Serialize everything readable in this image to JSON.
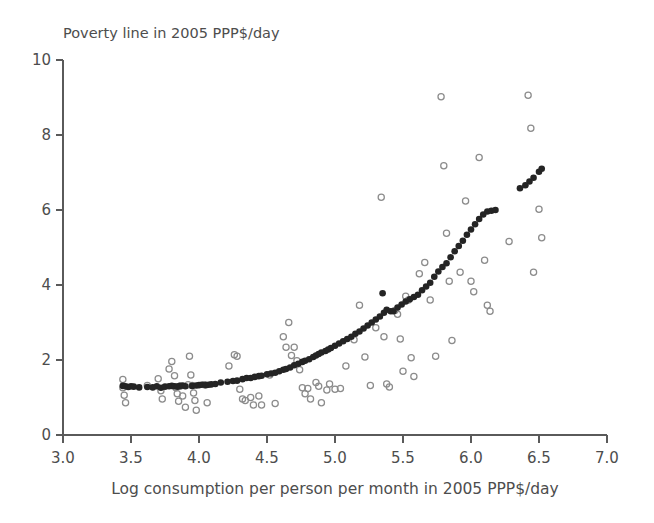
{
  "figure": {
    "title": "Poverty line in 2005 PPP$/day",
    "xlabel": "Log consumption per person per month in 2005 PPP$/day",
    "background": "#ffffff",
    "fitted_color": "#242424",
    "observed_color": "#8c8c8c",
    "axis_color": "#5a5a5a"
  },
  "chart_data": {
    "type": "scatter",
    "title": "Poverty line in 2005 PPP$/day",
    "xlabel": "Log consumption per person per month in 2005 PPP$/day",
    "ylabel": "Poverty line in 2005 PPP$/day",
    "xlim": [
      3.0,
      7.0
    ],
    "ylim": [
      0,
      10
    ],
    "xticks": [
      "3.0",
      "3.5",
      "4.0",
      "4.5",
      "5.0",
      "5.5",
      "6.0",
      "6.5",
      "7.0"
    ],
    "xtick_values": [
      3.0,
      3.5,
      4.0,
      4.5,
      5.0,
      5.5,
      6.0,
      6.5,
      7.0
    ],
    "yticks": [
      "0",
      "2",
      "4",
      "6",
      "8",
      "10"
    ],
    "ytick_values": [
      0,
      2,
      4,
      6,
      8,
      10
    ],
    "grid": false,
    "legend": false,
    "series": [
      {
        "name": "Fitted poverty line",
        "marker": "filled-circle",
        "color": "#242424",
        "points": [
          [
            3.44,
            1.31
          ],
          [
            3.46,
            1.3
          ],
          [
            3.48,
            1.28
          ],
          [
            3.5,
            1.3
          ],
          [
            3.52,
            1.29
          ],
          [
            3.56,
            1.27
          ],
          [
            3.62,
            1.28
          ],
          [
            3.66,
            1.27
          ],
          [
            3.69,
            1.3
          ],
          [
            3.72,
            1.26
          ],
          [
            3.75,
            1.29
          ],
          [
            3.78,
            1.3
          ],
          [
            3.8,
            1.31
          ],
          [
            3.82,
            1.3
          ],
          [
            3.84,
            1.29
          ],
          [
            3.86,
            1.31
          ],
          [
            3.88,
            1.32
          ],
          [
            3.9,
            1.3
          ],
          [
            3.95,
            1.31
          ],
          [
            3.98,
            1.32
          ],
          [
            4.0,
            1.33
          ],
          [
            4.02,
            1.34
          ],
          [
            4.05,
            1.33
          ],
          [
            4.07,
            1.34
          ],
          [
            4.09,
            1.35
          ],
          [
            4.12,
            1.36
          ],
          [
            4.16,
            1.4
          ],
          [
            4.21,
            1.42
          ],
          [
            4.25,
            1.44
          ],
          [
            4.28,
            1.45
          ],
          [
            4.32,
            1.49
          ],
          [
            4.35,
            1.52
          ],
          [
            4.38,
            1.52
          ],
          [
            4.41,
            1.55
          ],
          [
            4.44,
            1.57
          ],
          [
            4.46,
            1.58
          ],
          [
            4.5,
            1.62
          ],
          [
            4.53,
            1.64
          ],
          [
            4.56,
            1.66
          ],
          [
            4.59,
            1.7
          ],
          [
            4.62,
            1.74
          ],
          [
            4.64,
            1.76
          ],
          [
            4.67,
            1.8
          ],
          [
            4.7,
            1.86
          ],
          [
            4.73,
            1.9
          ],
          [
            4.76,
            1.95
          ],
          [
            4.78,
            1.98
          ],
          [
            4.81,
            2.02
          ],
          [
            4.84,
            2.08
          ],
          [
            4.86,
            2.12
          ],
          [
            4.88,
            2.16
          ],
          [
            4.9,
            2.2
          ],
          [
            4.93,
            2.24
          ],
          [
            4.95,
            2.28
          ],
          [
            4.97,
            2.32
          ],
          [
            5.0,
            2.38
          ],
          [
            5.03,
            2.44
          ],
          [
            5.06,
            2.5
          ],
          [
            5.09,
            2.56
          ],
          [
            5.12,
            2.62
          ],
          [
            5.15,
            2.7
          ],
          [
            5.18,
            2.76
          ],
          [
            5.21,
            2.84
          ],
          [
            5.24,
            2.92
          ],
          [
            5.27,
            3.0
          ],
          [
            5.3,
            3.08
          ],
          [
            5.33,
            3.16
          ],
          [
            5.36,
            3.26
          ],
          [
            5.38,
            3.34
          ],
          [
            5.41,
            3.3
          ],
          [
            5.43,
            3.3
          ],
          [
            5.35,
            3.78
          ],
          [
            5.46,
            3.4
          ],
          [
            5.49,
            3.48
          ],
          [
            5.52,
            3.56
          ],
          [
            5.55,
            3.62
          ],
          [
            5.58,
            3.68
          ],
          [
            5.61,
            3.74
          ],
          [
            5.64,
            3.86
          ],
          [
            5.67,
            3.96
          ],
          [
            5.7,
            4.06
          ],
          [
            5.73,
            4.22
          ],
          [
            5.76,
            4.36
          ],
          [
            5.79,
            4.48
          ],
          [
            5.82,
            4.58
          ],
          [
            5.85,
            4.74
          ],
          [
            5.88,
            4.9
          ],
          [
            5.91,
            5.04
          ],
          [
            5.94,
            5.18
          ],
          [
            5.97,
            5.34
          ],
          [
            6.0,
            5.48
          ],
          [
            6.03,
            5.62
          ],
          [
            6.06,
            5.76
          ],
          [
            6.09,
            5.88
          ],
          [
            6.12,
            5.96
          ],
          [
            6.15,
            5.98
          ],
          [
            6.18,
            6.0
          ],
          [
            6.36,
            6.58
          ],
          [
            6.4,
            6.66
          ],
          [
            6.43,
            6.76
          ],
          [
            6.46,
            6.86
          ],
          [
            6.5,
            7.02
          ],
          [
            6.52,
            7.1
          ]
        ]
      },
      {
        "name": "Observed poverty line",
        "marker": "open-circle",
        "color": "#8c8c8c",
        "points": [
          [
            3.44,
            1.48
          ],
          [
            3.44,
            1.26
          ],
          [
            3.45,
            1.06
          ],
          [
            3.46,
            0.86
          ],
          [
            3.62,
            1.32
          ],
          [
            3.7,
            1.5
          ],
          [
            3.72,
            1.18
          ],
          [
            3.73,
            0.96
          ],
          [
            3.78,
            1.76
          ],
          [
            3.8,
            1.96
          ],
          [
            3.82,
            1.58
          ],
          [
            3.83,
            1.26
          ],
          [
            3.84,
            1.1
          ],
          [
            3.85,
            0.9
          ],
          [
            3.86,
            1.3
          ],
          [
            3.88,
            1.04
          ],
          [
            3.9,
            0.74
          ],
          [
            3.92,
            1.34
          ],
          [
            3.93,
            2.1
          ],
          [
            3.94,
            1.6
          ],
          [
            3.95,
            1.32
          ],
          [
            3.96,
            1.12
          ],
          [
            3.97,
            0.92
          ],
          [
            3.98,
            0.66
          ],
          [
            4.04,
            1.34
          ],
          [
            4.06,
            0.86
          ],
          [
            4.22,
            1.84
          ],
          [
            4.26,
            2.14
          ],
          [
            4.28,
            2.1
          ],
          [
            4.3,
            1.22
          ],
          [
            4.32,
            0.96
          ],
          [
            4.34,
            0.92
          ],
          [
            4.38,
            1.0
          ],
          [
            4.4,
            0.8
          ],
          [
            4.44,
            1.04
          ],
          [
            4.46,
            0.8
          ],
          [
            4.52,
            1.6
          ],
          [
            4.56,
            0.84
          ],
          [
            4.62,
            2.62
          ],
          [
            4.64,
            2.34
          ],
          [
            4.66,
            3.0
          ],
          [
            4.68,
            2.12
          ],
          [
            4.7,
            2.34
          ],
          [
            4.72,
            1.98
          ],
          [
            4.74,
            1.74
          ],
          [
            4.76,
            1.26
          ],
          [
            4.78,
            1.1
          ],
          [
            4.8,
            1.24
          ],
          [
            4.82,
            0.96
          ],
          [
            4.86,
            1.4
          ],
          [
            4.88,
            1.3
          ],
          [
            4.9,
            0.86
          ],
          [
            4.94,
            1.2
          ],
          [
            4.96,
            1.36
          ],
          [
            5.0,
            1.22
          ],
          [
            5.04,
            1.24
          ],
          [
            5.08,
            1.84
          ],
          [
            5.14,
            2.54
          ],
          [
            5.18,
            3.46
          ],
          [
            5.22,
            2.08
          ],
          [
            5.26,
            1.32
          ],
          [
            5.3,
            2.86
          ],
          [
            5.34,
            6.34
          ],
          [
            5.36,
            2.62
          ],
          [
            5.38,
            1.36
          ],
          [
            5.4,
            1.28
          ],
          [
            5.44,
            3.32
          ],
          [
            5.46,
            3.22
          ],
          [
            5.48,
            2.56
          ],
          [
            5.5,
            1.7
          ],
          [
            5.52,
            3.7
          ],
          [
            5.54,
            3.6
          ],
          [
            5.56,
            2.06
          ],
          [
            5.58,
            1.56
          ],
          [
            5.62,
            4.3
          ],
          [
            5.66,
            4.6
          ],
          [
            5.7,
            3.6
          ],
          [
            5.74,
            2.1
          ],
          [
            5.78,
            9.02
          ],
          [
            5.8,
            7.18
          ],
          [
            5.82,
            5.38
          ],
          [
            5.84,
            4.1
          ],
          [
            5.86,
            2.52
          ],
          [
            5.92,
            4.34
          ],
          [
            5.96,
            6.24
          ],
          [
            6.0,
            4.1
          ],
          [
            6.02,
            3.82
          ],
          [
            6.06,
            7.4
          ],
          [
            6.1,
            4.66
          ],
          [
            6.12,
            3.46
          ],
          [
            6.14,
            3.3
          ],
          [
            6.28,
            5.16
          ],
          [
            6.42,
            9.06
          ],
          [
            6.44,
            8.18
          ],
          [
            6.46,
            4.34
          ],
          [
            6.5,
            6.02
          ],
          [
            6.52,
            5.26
          ]
        ]
      }
    ]
  }
}
